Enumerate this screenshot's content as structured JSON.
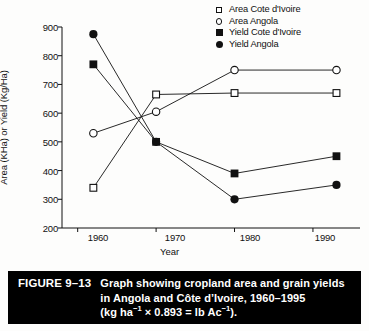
{
  "chart_data": {
    "type": "line",
    "title": "",
    "xlabel": "Year",
    "ylabel": "Area (KHa) or Yield (Kg/Ha)",
    "xlim": [
      1958,
      1996
    ],
    "ylim": [
      200,
      900
    ],
    "xticks": [
      1960,
      1970,
      1980,
      1990
    ],
    "yticks": [
      200,
      300,
      400,
      500,
      600,
      700,
      800,
      900
    ],
    "grid": false,
    "legend_position": "top-right",
    "x": [
      1962,
      1970,
      1980,
      1993
    ],
    "series": [
      {
        "name": "Area Cote d'Ivoire",
        "marker": "open-square",
        "values": [
          340,
          665,
          670,
          670
        ]
      },
      {
        "name": "Area Angola",
        "marker": "open-circle",
        "values": [
          530,
          605,
          750,
          750
        ]
      },
      {
        "name": "Yield Cote d'Ivoire",
        "marker": "filled-square",
        "values": [
          770,
          500,
          390,
          450
        ]
      },
      {
        "name": "Yield Angola",
        "marker": "filled-circle",
        "values": [
          875,
          500,
          300,
          350
        ]
      }
    ]
  },
  "axes": {
    "y_title": "Area (KHa) or Yield (Kg/Ha)",
    "x_title": "Year",
    "y_tick_labels": [
      "900",
      "800",
      "700",
      "600",
      "500",
      "400",
      "300",
      "200"
    ],
    "x_tick_labels": [
      "1960",
      "1970",
      "1980",
      "1990"
    ]
  },
  "legend": {
    "items": [
      {
        "label": "Area Cote d'Ivoire",
        "icon": "open-square-icon"
      },
      {
        "label": "Area Angola",
        "icon": "open-circle-icon"
      },
      {
        "label": "Yield Cote d'Ivoire",
        "icon": "filled-square-icon"
      },
      {
        "label": "Yield Angola",
        "icon": "filled-circle-icon"
      }
    ]
  },
  "caption": {
    "figure_number": "FIGURE 9–13",
    "line1": "Graph showing cropland area and grain yields",
    "line2": "in Angola and Côte d’Ivoire, 1960–1995",
    "line3_prefix": "(kg ha",
    "line3_sup1": "−1",
    "line3_mid": " × 0.893 = lb Ac",
    "line3_sup2": "−1",
    "line3_suffix": ")."
  },
  "colors": {
    "ink": "#111111",
    "caption_bg": "#000000",
    "caption_fg": "#ffffff",
    "page_bg": "#fdfdfc"
  }
}
